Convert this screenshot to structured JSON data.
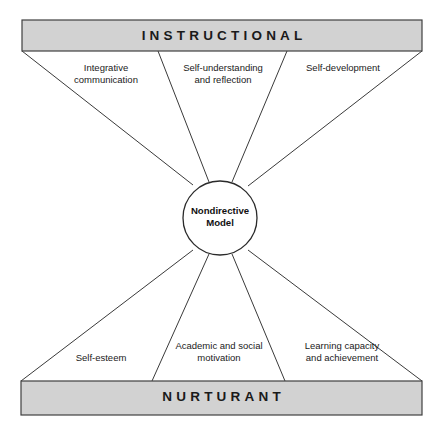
{
  "diagram": {
    "title_top": "INSTRUCTIONAL",
    "title_bottom": "NURTURANT",
    "center": {
      "line1": "Nondirective",
      "line2": "Model"
    },
    "colors": {
      "band_fill": "#d2d2d2",
      "band_stroke": "#404040",
      "line_stroke": "#3a3a3a",
      "text": "#1a1a1a",
      "background": "#ffffff"
    },
    "instructional_effects": [
      {
        "line1": "Integrative",
        "line2": "communication"
      },
      {
        "line1": "Self-understanding",
        "line2": "and reflection"
      },
      {
        "line1": "Self-development",
        "line2": ""
      }
    ],
    "nurturant_effects": [
      {
        "line1": "Self-esteem",
        "line2": ""
      },
      {
        "line1": "Academic and social",
        "line2": "motivation"
      },
      {
        "line1": "Learning capacity",
        "line2": "and achievement"
      }
    ]
  }
}
